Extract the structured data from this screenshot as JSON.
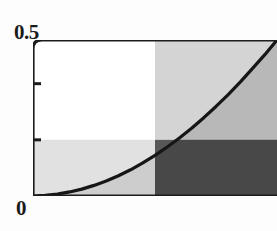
{
  "chart": {
    "y_max_label": "0.5",
    "y_min_label": "0",
    "axis_color": "#1c1c1c",
    "curve_color": "#161616",
    "fill_under_curve": "#9a9a9a",
    "quadrant_upper_right": "#c3c3c3",
    "quadrant_lower_left": "#d9d9d9",
    "quadrant_lower_right": "#3a3a3a",
    "background": "#ffffff"
  },
  "chart_data": {
    "type": "area",
    "title": "",
    "xlabel": "",
    "ylabel": "",
    "ylim": [
      0,
      0.5
    ],
    "xlim": [
      0,
      1
    ],
    "grid": false,
    "legend": null,
    "y_ticks": [
      0,
      0.18,
      0.36,
      0.5
    ],
    "y_tick_labels": [
      "0",
      "",
      "",
      "0.5"
    ],
    "x_ticks": [],
    "x_tick_labels": [],
    "series": [
      {
        "name": "curve",
        "x": [
          0.0,
          0.05,
          0.1,
          0.15,
          0.2,
          0.25,
          0.3,
          0.35,
          0.4,
          0.45,
          0.5,
          0.55,
          0.6,
          0.65,
          0.7,
          0.75,
          0.8,
          0.85,
          0.9,
          0.95,
          1.0
        ],
        "y": [
          0.0,
          0.002,
          0.006,
          0.013,
          0.022,
          0.034,
          0.048,
          0.065,
          0.084,
          0.106,
          0.13,
          0.157,
          0.186,
          0.217,
          0.251,
          0.287,
          0.325,
          0.366,
          0.409,
          0.453,
          0.5
        ],
        "fill": true
      }
    ],
    "shaded_regions": [
      {
        "name": "upper-right-block",
        "x_range": [
          0.5,
          1.0
        ],
        "y_range": [
          0.18,
          0.5
        ],
        "shade": "light-gray"
      },
      {
        "name": "lower-left-band",
        "x_range": [
          0.0,
          0.5
        ],
        "y_range": [
          0.0,
          0.18
        ],
        "shade": "very-light-gray"
      },
      {
        "name": "lower-right-block",
        "x_range": [
          0.5,
          1.0
        ],
        "y_range": [
          0.0,
          0.18
        ],
        "shade": "dark-gray"
      }
    ]
  }
}
